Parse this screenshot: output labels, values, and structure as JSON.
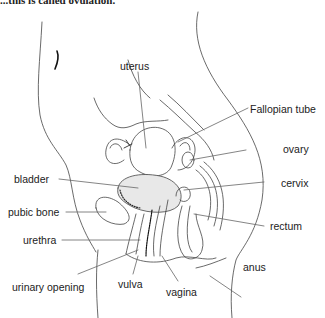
{
  "caption": "...this is called ovulation.",
  "diagram": {
    "labels": [
      {
        "id": "uterus",
        "text": "uterus"
      },
      {
        "id": "fallopian_tube",
        "text": "Fallopian tube"
      },
      {
        "id": "ovary",
        "text": "ovary"
      },
      {
        "id": "bladder",
        "text": "bladder"
      },
      {
        "id": "cervix",
        "text": "cervix"
      },
      {
        "id": "pubic_bone",
        "text": "pubic bone"
      },
      {
        "id": "rectum",
        "text": "rectum"
      },
      {
        "id": "urethra",
        "text": "urethra"
      },
      {
        "id": "anus",
        "text": "anus"
      },
      {
        "id": "urinary_opening",
        "text": "urinary opening"
      },
      {
        "id": "vulva",
        "text": "vulva"
      },
      {
        "id": "vagina",
        "text": "vagina"
      }
    ]
  }
}
